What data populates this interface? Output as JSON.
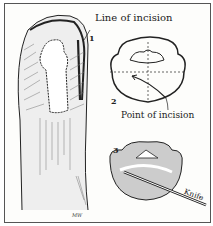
{
  "figure": {
    "title_label": "Line of incision",
    "panels": [
      {
        "number": "1",
        "subject": "finger-dorsal-view"
      },
      {
        "number": "2",
        "subject": "cross-section-diagram",
        "annotation": "Point of incision"
      },
      {
        "number": "3",
        "subject": "cross-section-with-knife",
        "annotation": "Knife"
      }
    ],
    "signature": "MW",
    "colors": {
      "ink": "#222222",
      "paper": "#fdfdfb",
      "border": "#555555"
    }
  }
}
